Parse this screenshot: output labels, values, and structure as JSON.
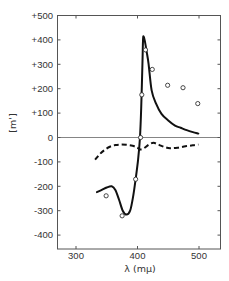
{
  "chart_data": {
    "type": "line",
    "title": "",
    "xlabel": "λ (mμ)",
    "ylabel": "[m']",
    "xlim": [
      269,
      534
    ],
    "ylim": [
      -459,
      500
    ],
    "grid": false,
    "legend": null,
    "x_ticks": [
      300,
      400,
      500
    ],
    "x_tick_labels": [
      "300",
      "400",
      "500"
    ],
    "y_ticks": [
      500,
      400,
      300,
      200,
      100,
      0,
      -100,
      -200,
      -300,
      -400
    ],
    "y_tick_labels": [
      "+500",
      "+400",
      "+300",
      "+200",
      "+100",
      "0",
      "-100",
      "-200",
      "-300",
      "-400"
    ],
    "zero_line": true,
    "series": [
      {
        "name": "solid curve",
        "style": "solid",
        "x": [
          334,
          342,
          350,
          358,
          364,
          370,
          376,
          382,
          388,
          393,
          397,
          401,
          404,
          406,
          408,
          409,
          410,
          412,
          415,
          418,
          423,
          430,
          439,
          450,
          461,
          470,
          480,
          490,
          499
        ],
        "y": [
          -224,
          -215,
          -205,
          -200,
          -215,
          -255,
          -300,
          -316,
          -300,
          -240,
          -170,
          -90,
          0,
          120,
          300,
          400,
          414,
          395,
          350,
          302,
          193,
          140,
          97,
          70,
          49,
          40,
          30,
          22,
          16
        ]
      },
      {
        "name": "dashed curve",
        "style": "dashed",
        "x": [
          331,
          338,
          346,
          355,
          364,
          372,
          382,
          392,
          400,
          404,
          410,
          418,
          426,
          435,
          445,
          453,
          465,
          478,
          490,
          499
        ],
        "y": [
          -91,
          -70,
          -52,
          -38,
          -31,
          -29,
          -30,
          -34,
          -42,
          -49,
          -45,
          -30,
          -22,
          -30,
          -40,
          -44,
          -42,
          -36,
          -32,
          -29
        ]
      },
      {
        "name": "data points",
        "style": "open-circles",
        "x": [
          349,
          375,
          397,
          405,
          407,
          413,
          424,
          449,
          474,
          498
        ],
        "y": [
          -239,
          -321,
          -171,
          0,
          175,
          359,
          279,
          214,
          204,
          139
        ]
      }
    ]
  }
}
